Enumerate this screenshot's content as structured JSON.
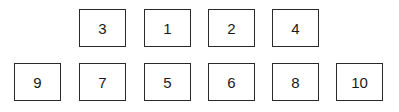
{
  "diagram": {
    "top_row": [
      {
        "label": "3",
        "x": 79,
        "y": 9
      },
      {
        "label": "1",
        "x": 144,
        "y": 9
      },
      {
        "label": "2",
        "x": 208,
        "y": 9
      },
      {
        "label": "4",
        "x": 272,
        "y": 9
      }
    ],
    "bottom_row": [
      {
        "label": "9",
        "x": 14,
        "y": 63
      },
      {
        "label": "7",
        "x": 79,
        "y": 63
      },
      {
        "label": "5",
        "x": 144,
        "y": 63
      },
      {
        "label": "6",
        "x": 208,
        "y": 63
      },
      {
        "label": "8",
        "x": 272,
        "y": 63
      },
      {
        "label": "10",
        "x": 336,
        "y": 63
      }
    ],
    "border_color": "#2a2a2a",
    "background": "#ffffff"
  }
}
